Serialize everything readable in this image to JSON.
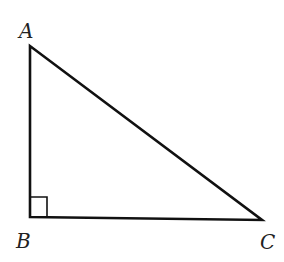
{
  "diagram": {
    "type": "right-triangle",
    "stroke_color": "#111111",
    "vertices": [
      {
        "name": "A",
        "x": 30,
        "y": 46,
        "label_x": 19,
        "label_y": 38
      },
      {
        "name": "B",
        "x": 30,
        "y": 217,
        "label_x": 16,
        "label_y": 248
      },
      {
        "name": "C",
        "x": 262,
        "y": 220,
        "label_x": 260,
        "label_y": 249
      }
    ],
    "right_angle_at": "B",
    "right_angle_marker_size": 17
  }
}
